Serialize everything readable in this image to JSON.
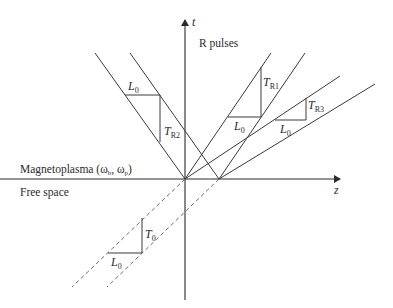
{
  "figure": {
    "axes": {
      "t_label": "t",
      "z_label": "z"
    },
    "region_labels": {
      "upper": "Magnetoplasma (ω",
      "upper_sub1": "b",
      "upper_sep": ", ω",
      "upper_sub2": "p",
      "upper_close": ")",
      "lower": "Free space"
    },
    "pulse_label": "R pulses",
    "triangles": [
      {
        "id": "R2",
        "length_label": "L",
        "length_sub": "0",
        "time_label": "T",
        "time_sub": "R2"
      },
      {
        "id": "R1",
        "length_label": "L",
        "length_sub": "0",
        "time_label": "T",
        "time_sub": "R1"
      },
      {
        "id": "R3",
        "length_label": "L",
        "length_sub": "0",
        "time_label": "T",
        "time_sub": "R3"
      },
      {
        "id": "incident",
        "length_label": "L",
        "length_sub": "0",
        "time_label": "T",
        "time_sub": "0"
      }
    ],
    "colors": {
      "line": "#3a3a3a",
      "dashed": "#6a6a6a",
      "text": "#2b2b2b",
      "background": "#ffffff"
    }
  }
}
